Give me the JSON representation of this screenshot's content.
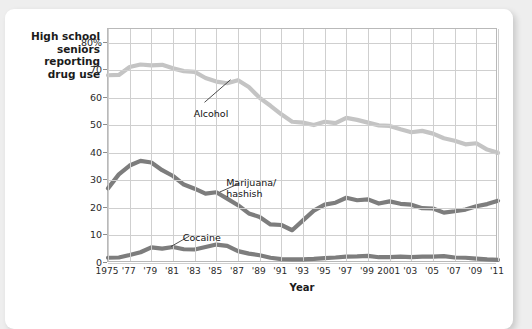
{
  "chart_data": {
    "type": "line",
    "title": "",
    "ylabel": "High school\nseniors\nreporting\ndrug use",
    "xlabel": "Year",
    "ylim": [
      0,
      85
    ],
    "xlim": [
      1975,
      2011
    ],
    "grid": true,
    "legend_position": "inline-annotations",
    "ytick_labels": [
      "0",
      "10",
      "20",
      "30",
      "40",
      "50",
      "60",
      "70",
      "80%"
    ],
    "ytick_values": [
      0,
      10,
      20,
      30,
      40,
      50,
      60,
      70,
      80
    ],
    "xtick_labels": [
      "1975",
      "'77",
      "'79",
      "'81",
      "'83",
      "'85",
      "'87",
      "'89",
      "'91",
      "'93",
      "'95",
      "'97",
      "'99",
      "2001",
      "'03",
      "'05",
      "'07",
      "'09",
      "'11"
    ],
    "xtick_values": [
      1975,
      1977,
      1979,
      1981,
      1983,
      1985,
      1987,
      1989,
      1991,
      1993,
      1995,
      1997,
      1999,
      2001,
      2003,
      2005,
      2007,
      2009,
      2011
    ],
    "x": [
      1975,
      1976,
      1977,
      1978,
      1979,
      1980,
      1981,
      1982,
      1983,
      1984,
      1985,
      1986,
      1987,
      1988,
      1989,
      1990,
      1991,
      1992,
      1993,
      1994,
      1995,
      1996,
      1997,
      1998,
      1999,
      2000,
      2001,
      2002,
      2003,
      2004,
      2005,
      2006,
      2007,
      2008,
      2009,
      2010,
      2011
    ],
    "series": [
      {
        "name": "Alcohol",
        "color": "#c4c4c4",
        "label_x": 1983,
        "label_y": 56,
        "values": [
          68.2,
          68.3,
          71.2,
          72.1,
          71.8,
          72.0,
          70.7,
          69.7,
          69.4,
          67.2,
          65.9,
          65.3,
          66.4,
          63.9,
          60.0,
          57.1,
          54.0,
          51.3,
          51.0,
          50.1,
          51.3,
          50.8,
          52.7,
          52.0,
          51.0,
          50.0,
          49.8,
          48.6,
          47.5,
          48.0,
          47.0,
          45.3,
          44.4,
          43.1,
          43.5,
          41.2,
          40.0
        ]
      },
      {
        "name": "Marijuana/\nhashish",
        "color": "#7d7d7d",
        "label_x": 1986,
        "label_y": 31,
        "values": [
          27.1,
          32.2,
          35.4,
          37.1,
          36.5,
          33.7,
          31.6,
          28.5,
          27.0,
          25.2,
          25.7,
          23.4,
          21.0,
          18.0,
          16.7,
          14.0,
          13.8,
          11.9,
          15.5,
          19.0,
          21.2,
          21.9,
          23.7,
          22.8,
          23.1,
          21.6,
          22.4,
          21.5,
          21.2,
          19.9,
          19.8,
          18.3,
          18.8,
          19.4,
          20.6,
          21.4,
          22.6
        ]
      },
      {
        "name": "Cocaine",
        "color": "#7d7d7d",
        "label_x": 1982,
        "label_y": 11,
        "values": [
          1.9,
          2.0,
          2.9,
          3.9,
          5.7,
          5.2,
          5.8,
          5.0,
          4.9,
          5.8,
          6.7,
          6.2,
          4.3,
          3.4,
          2.8,
          1.9,
          1.4,
          1.3,
          1.3,
          1.5,
          1.8,
          2.0,
          2.3,
          2.4,
          2.6,
          2.1,
          2.1,
          2.3,
          2.1,
          2.3,
          2.3,
          2.5,
          2.0,
          1.9,
          1.6,
          1.3,
          1.1
        ]
      }
    ],
    "annotations": [
      {
        "text": "Alcohol",
        "leader_from": [
          1984.0,
          58.0
        ],
        "leader_to": [
          1986.4,
          66.2
        ]
      },
      {
        "text": "Marijuana/\nhashish",
        "leader_from": [
          1987.2,
          28.5
        ],
        "leader_to": [
          1985.4,
          25.4
        ]
      },
      {
        "text": "Cocaine",
        "leader_from": [
          1982.6,
          9.4
        ],
        "leader_to": [
          1980.9,
          5.6
        ]
      }
    ]
  }
}
